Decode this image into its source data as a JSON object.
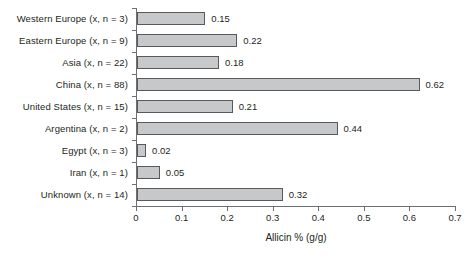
{
  "chart_data": {
    "type": "bar",
    "orientation": "horizontal",
    "title": "",
    "xlabel": "Allicin % (g/g)",
    "ylabel": "",
    "xlim": [
      0,
      0.7
    ],
    "xticks": [
      "0",
      "0.1",
      "0.2",
      "0.3",
      "0.4",
      "0.5",
      "0.6",
      "0.7"
    ],
    "xtick_values": [
      0,
      0.1,
      0.2,
      0.3,
      0.4,
      0.5,
      0.6,
      0.7
    ],
    "grid": false,
    "legend": null,
    "categories": [
      "Western Europe (x, n = 3)",
      "Eastern Europe (x, n = 9)",
      "Asia (x, n = 22)",
      "China (x, n = 88)",
      "United States (x, n = 15)",
      "Argentina (x, n = 2)",
      "Egypt (x, n = 3)",
      "Iran (x, n = 1)",
      "Unknown (x, n = 14)"
    ],
    "values": [
      0.15,
      0.22,
      0.18,
      0.62,
      0.21,
      0.44,
      0.02,
      0.05,
      0.32
    ],
    "value_labels": [
      "0.15",
      "0.22",
      "0.18",
      "0.62",
      "0.21",
      "0.44",
      "0.02",
      "0.05",
      "0.32"
    ],
    "bar_fill_color": "#c7c8ca",
    "bar_border_color": "#58595b",
    "axis_color": "#6d6e71",
    "text_color": "#231f20",
    "background_color": "#ffffff"
  }
}
